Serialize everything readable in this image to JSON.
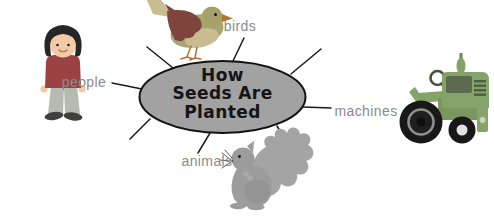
{
  "diagram": {
    "center_topic": {
      "line1": "How",
      "line2": "Seeds Are",
      "line3": "Planted"
    },
    "branches": [
      {
        "id": "people",
        "label": "people"
      },
      {
        "id": "birds",
        "label": "birds"
      },
      {
        "id": "machines",
        "label": "machines"
      },
      {
        "id": "animals",
        "label": "animals"
      }
    ],
    "illustrations": [
      {
        "id": "girl-illustration",
        "depicts": "standing child for people branch"
      },
      {
        "id": "bird-illustration",
        "depicts": "perched bird for birds branch"
      },
      {
        "id": "tractor-illustration",
        "depicts": "green farm tractor for machines branch"
      },
      {
        "id": "squirrel-illustration",
        "depicts": "gray squirrel for animals branch"
      }
    ],
    "colors": {
      "ellipse_fill": "#a2a2a2",
      "ellipse_stroke": "#111111",
      "connector_line": "#1a1a1a",
      "label_text": "#8b8b8b",
      "center_text": "#151515"
    }
  }
}
